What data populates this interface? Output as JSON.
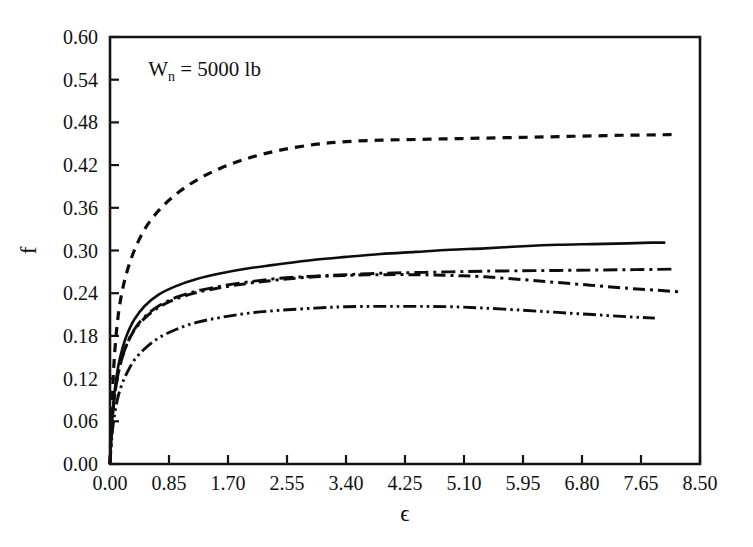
{
  "chart_data": {
    "type": "line",
    "title": "",
    "subtitle": "",
    "xlabel": "ϵ",
    "ylabel": "f",
    "xlim": [
      0.0,
      8.5
    ],
    "ylim": [
      0.0,
      0.6
    ],
    "grid": false,
    "legend": "none",
    "annotations": [
      {
        "name": "normal-load-annotation",
        "text_prefix": "W",
        "text_subscript": "n",
        "text_suffix": " = 5000 lb",
        "full_text": "W_n = 5000 lb",
        "x_data": 0.55,
        "y_data": 0.545
      }
    ],
    "x_ticks": [
      0.0,
      0.85,
      1.7,
      2.55,
      3.4,
      4.25,
      5.1,
      5.95,
      6.8,
      7.65,
      8.5
    ],
    "x_tick_labels": [
      "0.00",
      "0.85",
      "1.70",
      "2.55",
      "3.40",
      "4.25",
      "5.10",
      "5.95",
      "6.80",
      "7.65",
      "8.50"
    ],
    "y_ticks": [
      0.0,
      0.06,
      0.12,
      0.18,
      0.24,
      0.3,
      0.36,
      0.42,
      0.48,
      0.54,
      0.6
    ],
    "y_tick_labels": [
      "0.00",
      "0.06",
      "0.12",
      "0.18",
      "0.24",
      "0.30",
      "0.36",
      "0.42",
      "0.48",
      "0.54",
      "0.60"
    ],
    "series": [
      {
        "name": "curve-dashed-upper",
        "style": "dashed",
        "dash_array": "9,7",
        "width": 3.2,
        "color": "#0d0d0d",
        "x": [
          0.0,
          0.03,
          0.07,
          0.12,
          0.18,
          0.25,
          0.35,
          0.5,
          0.7,
          0.95,
          1.25,
          1.6,
          2.0,
          2.45,
          2.95,
          3.4,
          3.9,
          4.4,
          4.9,
          5.4,
          5.95,
          6.45,
          6.95,
          7.45,
          7.9,
          8.1
        ],
        "y": [
          0.0,
          0.09,
          0.16,
          0.21,
          0.245,
          0.272,
          0.3,
          0.33,
          0.356,
          0.379,
          0.399,
          0.416,
          0.43,
          0.441,
          0.449,
          0.453,
          0.455,
          0.456,
          0.457,
          0.458,
          0.459,
          0.46,
          0.461,
          0.462,
          0.4625,
          0.463
        ]
      },
      {
        "name": "curve-solid",
        "style": "solid",
        "dash_array": "none",
        "width": 2.6,
        "color": "#0d0d0d",
        "x": [
          0.0,
          0.03,
          0.07,
          0.12,
          0.18,
          0.25,
          0.35,
          0.5,
          0.7,
          0.95,
          1.25,
          1.6,
          2.0,
          2.45,
          2.95,
          3.4,
          3.9,
          4.4,
          4.9,
          5.4,
          5.95,
          6.45,
          6.95,
          7.45,
          7.8,
          8.0
        ],
        "y": [
          0.0,
          0.062,
          0.105,
          0.138,
          0.163,
          0.183,
          0.203,
          0.222,
          0.238,
          0.25,
          0.26,
          0.268,
          0.275,
          0.281,
          0.287,
          0.291,
          0.295,
          0.298,
          0.301,
          0.303,
          0.306,
          0.308,
          0.309,
          0.31,
          0.311,
          0.311
        ]
      },
      {
        "name": "curve-dashdot-upper",
        "style": "dash-dot",
        "dash_array": "14,5,3,5",
        "width": 2.9,
        "color": "#0d0d0d",
        "x": [
          0.0,
          0.03,
          0.07,
          0.12,
          0.18,
          0.25,
          0.35,
          0.5,
          0.7,
          0.95,
          1.25,
          1.6,
          2.0,
          2.45,
          2.95,
          3.4,
          3.9,
          4.4,
          4.9,
          5.4,
          5.95,
          6.45,
          6.95,
          7.45,
          7.9,
          8.15
        ],
        "y": [
          0.0,
          0.058,
          0.098,
          0.128,
          0.151,
          0.17,
          0.189,
          0.207,
          0.222,
          0.234,
          0.243,
          0.25,
          0.256,
          0.261,
          0.264,
          0.266,
          0.268,
          0.269,
          0.27,
          0.271,
          0.2715,
          0.272,
          0.2725,
          0.273,
          0.2735,
          0.274
        ]
      },
      {
        "name": "curve-dashdot-declining",
        "style": "dash-dot",
        "dash_array": "12,5,3,5",
        "width": 3.0,
        "color": "#0d0d0d",
        "x": [
          0.0,
          0.03,
          0.07,
          0.12,
          0.18,
          0.25,
          0.35,
          0.5,
          0.7,
          0.95,
          1.25,
          1.6,
          2.0,
          2.45,
          2.95,
          3.4,
          3.9,
          4.4,
          4.9,
          5.4,
          5.95,
          6.45,
          6.95,
          7.45,
          7.9,
          8.2
        ],
        "y": [
          0.0,
          0.058,
          0.098,
          0.128,
          0.151,
          0.17,
          0.188,
          0.205,
          0.22,
          0.232,
          0.241,
          0.248,
          0.254,
          0.259,
          0.263,
          0.265,
          0.266,
          0.266,
          0.265,
          0.263,
          0.259,
          0.255,
          0.251,
          0.247,
          0.244,
          0.242
        ]
      },
      {
        "name": "curve-dashdotdot-lower",
        "style": "dash-dot-dot",
        "dash_array": "13,4,2.5,4,2.5,4",
        "width": 2.9,
        "color": "#0d0d0d",
        "x": [
          0.0,
          0.03,
          0.07,
          0.12,
          0.18,
          0.25,
          0.35,
          0.5,
          0.7,
          0.95,
          1.25,
          1.6,
          2.0,
          2.45,
          2.95,
          3.4,
          3.9,
          4.4,
          4.9,
          5.4,
          5.95,
          6.45,
          6.95,
          7.45,
          7.85
        ],
        "y": [
          0.0,
          0.042,
          0.072,
          0.096,
          0.114,
          0.129,
          0.146,
          0.162,
          0.177,
          0.189,
          0.199,
          0.206,
          0.212,
          0.216,
          0.219,
          0.221,
          0.2215,
          0.2215,
          0.221,
          0.219,
          0.216,
          0.213,
          0.21,
          0.207,
          0.205
        ]
      }
    ]
  },
  "plot_geometry": {
    "left": 110,
    "right": 700,
    "top": 37,
    "bottom": 464
  }
}
